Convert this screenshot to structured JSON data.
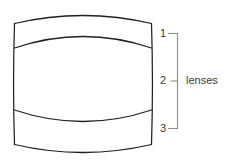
{
  "diagram": {
    "colors": {
      "outline": "#231f20",
      "bracket": "#8d8d8d",
      "text": "#3a3a3a",
      "background": "#ffffff"
    },
    "body": {
      "name": "barrel-body",
      "description": "rounded barrel outline divided into three regions by two arcs"
    },
    "regions": [
      {
        "id": "region-1",
        "label": "1"
      },
      {
        "id": "region-2",
        "label": "2"
      },
      {
        "id": "region-3",
        "label": "3"
      }
    ],
    "bracket": {
      "label": "lenses"
    }
  }
}
